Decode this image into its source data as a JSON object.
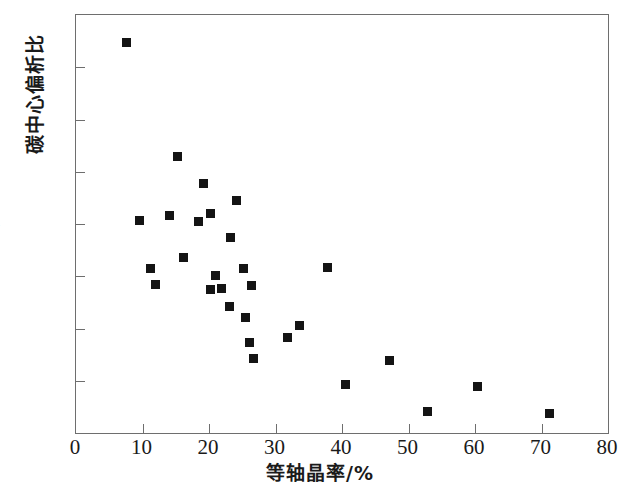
{
  "chart_data": {
    "type": "scatter",
    "title": "",
    "xlabel": "等轴晶率/%",
    "ylabel": "碳中心偏析比",
    "xlim": [
      0,
      80
    ],
    "ylim": [
      1.0,
      1.8
    ],
    "xticks": [
      0,
      10,
      20,
      30,
      40,
      50,
      60,
      70,
      80
    ],
    "yticks": [
      1.0,
      1.1,
      1.2,
      1.3,
      1.4,
      1.5,
      1.6,
      1.7,
      1.8
    ],
    "xtick_labels": [
      "0",
      "10",
      "20",
      "30",
      "40",
      "50",
      "60",
      "70",
      "80"
    ],
    "ytick_labels": [
      "1.0",
      "1.1",
      "1.2",
      "1.3",
      "1.4",
      "1.5",
      "1.6",
      "1.7",
      "1.8"
    ],
    "grid": false,
    "legend": null,
    "marker": {
      "shape": "square",
      "color": "#141414",
      "size": 9
    },
    "points": [
      {
        "x": 7.7,
        "y": 1.746
      },
      {
        "x": 9.6,
        "y": 1.406
      },
      {
        "x": 11.3,
        "y": 1.314
      },
      {
        "x": 12.0,
        "y": 1.284
      },
      {
        "x": 15.3,
        "y": 1.528
      },
      {
        "x": 14.1,
        "y": 1.416
      },
      {
        "x": 16.3,
        "y": 1.334
      },
      {
        "x": 19.3,
        "y": 1.476
      },
      {
        "x": 18.5,
        "y": 1.404
      },
      {
        "x": 20.3,
        "y": 1.42
      },
      {
        "x": 21.0,
        "y": 1.3
      },
      {
        "x": 20.3,
        "y": 1.274
      },
      {
        "x": 22.0,
        "y": 1.276
      },
      {
        "x": 23.2,
        "y": 1.242
      },
      {
        "x": 23.3,
        "y": 1.374
      },
      {
        "x": 24.2,
        "y": 1.444
      },
      {
        "x": 25.3,
        "y": 1.314
      },
      {
        "x": 25.6,
        "y": 1.22
      },
      {
        "x": 26.5,
        "y": 1.282
      },
      {
        "x": 26.2,
        "y": 1.172
      },
      {
        "x": 26.8,
        "y": 1.142
      },
      {
        "x": 31.9,
        "y": 1.182
      },
      {
        "x": 33.7,
        "y": 1.204
      },
      {
        "x": 37.9,
        "y": 1.316
      },
      {
        "x": 40.6,
        "y": 1.092
      },
      {
        "x": 47.2,
        "y": 1.138
      },
      {
        "x": 52.9,
        "y": 1.04
      },
      {
        "x": 60.5,
        "y": 1.088
      },
      {
        "x": 71.3,
        "y": 1.036
      }
    ]
  },
  "axes": {
    "x_title": "等轴晶率/%",
    "y_title": "碳中心偏析比"
  }
}
